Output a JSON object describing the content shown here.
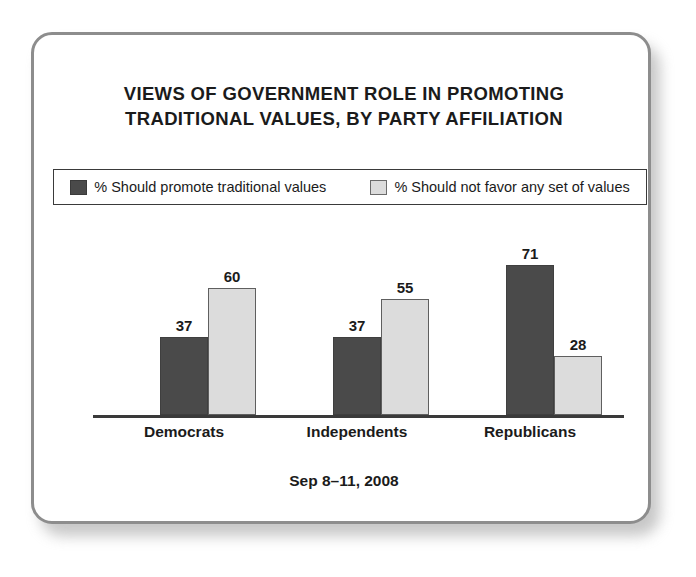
{
  "frame": {
    "border_color": "#8d8d8d",
    "background": "#ffffff"
  },
  "title": {
    "line1": "VIEWS OF GOVERNMENT ROLE IN PROMOTING",
    "line2": "TRADITIONAL VALUES, BY PARTY AFFILIATION"
  },
  "legend": {
    "items": [
      {
        "label": "% Should promote traditional values",
        "color": "#4a4a4a",
        "swatch_name": "legend-swatch-dark"
      },
      {
        "label": "% Should not favor any set of values",
        "color": "#dcdcdc",
        "swatch_name": "legend-swatch-light"
      }
    ]
  },
  "footer": {
    "date": "Sep 8–11, 2008"
  },
  "chart_data": {
    "type": "bar",
    "title": "VIEWS OF GOVERNMENT ROLE IN PROMOTING TRADITIONAL VALUES, BY PARTY AFFILIATION",
    "subtitle": "Sep 8–11, 2008",
    "xlabel": "",
    "ylabel": "",
    "ylim": [
      0,
      100
    ],
    "grid": false,
    "legend_position": "top",
    "categories": [
      "Democrats",
      "Independents",
      "Republicans"
    ],
    "series": [
      {
        "name": "% Should promote traditional values",
        "color": "#4a4a4a",
        "values": [
          37,
          37,
          71
        ],
        "labels": [
          "37",
          "37",
          "71"
        ]
      },
      {
        "name": "% Should not favor any set of values",
        "color": "#dcdcdc",
        "values": [
          60,
          55,
          28
        ],
        "labels": [
          "60",
          "55",
          "28"
        ]
      }
    ]
  }
}
